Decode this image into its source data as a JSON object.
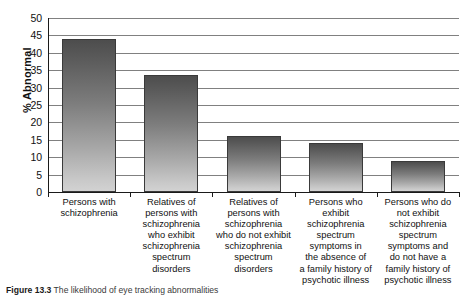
{
  "chart_data": {
    "type": "bar",
    "title": "",
    "xlabel": "",
    "ylabel": "% Abnormal",
    "ylim": [
      0,
      50
    ],
    "ytick_step": 5,
    "yticks": [
      50,
      45,
      40,
      35,
      30,
      25,
      20,
      15,
      10,
      5,
      0
    ],
    "grid": true,
    "legend": "none",
    "categories": [
      "Persons with schizophrenia",
      "Relatives of persons with schizophrenia who exhibit schizophrenia spectrum disorders",
      "Relatives of persons with schizophrenia who do not exhibit schizophrenia spectrum disorders",
      "Persons who exhibit schizophrenia spectrum symptoms in the absence of a family history of psychotic illness",
      "Persons who do not exhibit schizophrenia spectrum symptoms and do not have a family history of psychotic illness"
    ],
    "category_lines": [
      [
        "Persons with",
        "schizophrenia"
      ],
      [
        "Relatives of",
        "persons with",
        "schizophrenia",
        "who exhibit",
        "schizophrenia",
        "spectrum",
        "disorders"
      ],
      [
        "Relatives of",
        "persons with",
        "schizophrenia",
        "who do not exhibit",
        "schizophrenia",
        "spectrum",
        "disorders"
      ],
      [
        "Persons who",
        "exhibit",
        "schizophrenia",
        "spectrum",
        "symptoms in",
        "the absence of",
        "a family history of",
        "psychotic illness"
      ],
      [
        "Persons who do",
        "not exhibit",
        "schizophrenia",
        "spectrum",
        "symptoms and",
        "do not have a",
        "family history of",
        "psychotic illness"
      ]
    ],
    "values": [
      44,
      33.5,
      16,
      14,
      9
    ],
    "bar_gradient_top": "#4d4d4d",
    "bar_gradient_bottom": "#d2d2d2",
    "bar_border": "#3a3a3a",
    "gridline_color": "#808080",
    "axis_color": "#1a1a1a"
  },
  "caption": {
    "figure_number": "Figure 13.3",
    "text": "The likelihood of eye tracking abnormalities"
  }
}
